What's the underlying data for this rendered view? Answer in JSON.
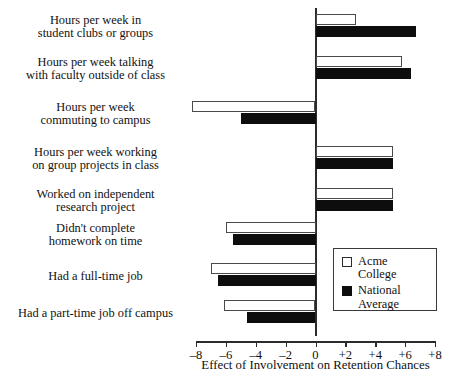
{
  "chart_data": {
    "type": "bar",
    "orientation": "horizontal",
    "title": "",
    "xlabel": "Effect of Involvement on Retention Chances",
    "ylabel": "",
    "xlim": [
      -8,
      8
    ],
    "xticks": [
      -8,
      -6,
      -4,
      -2,
      0,
      2,
      4,
      6,
      8
    ],
    "xticklabels": [
      "–8",
      "–6",
      "–4",
      "–2",
      "0",
      "+2",
      "+4",
      "+6",
      "+8"
    ],
    "grid": false,
    "legend_position": "lower-right",
    "categories": [
      "Hours per week in\nstudent clubs or groups",
      "Hours per week talking\nwith faculty outside of class",
      "Hours per week\ncommuting to campus",
      "Hours per week working\non group projects in class",
      "Worked on independent\nresearch project",
      "Didn't complete\nhomework on time",
      "Had a full-time job",
      "Had a part-time job off campus"
    ],
    "series": [
      {
        "name": "Acme\nCollege",
        "name_flat": "Acme College",
        "color": "#ffffff",
        "edgecolor": "#4a4a4a",
        "values": [
          2.7,
          5.8,
          -8.3,
          5.2,
          5.2,
          -6.0,
          -7.0,
          -6.1
        ]
      },
      {
        "name": "National\nAverage",
        "name_flat": "National Average",
        "color": "#0d0d0d",
        "edgecolor": "#0d0d0d",
        "values": [
          6.7,
          6.4,
          -5.0,
          5.2,
          5.2,
          -5.5,
          -6.5,
          -4.6
        ]
      }
    ]
  },
  "colors": {
    "background": "#ffffff",
    "axis": "#2b2b2b",
    "text": "#111111",
    "acme_fill": "#ffffff",
    "national_fill": "#0d0d0d"
  }
}
